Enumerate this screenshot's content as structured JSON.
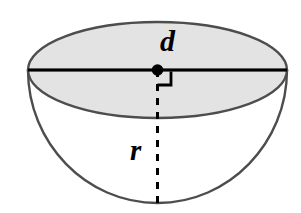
{
  "figure": {
    "name": "hemisphere-diagram",
    "background_color": "#ffffff",
    "labels": {
      "diameter": "d",
      "radius": "r"
    },
    "colors": {
      "outline": "#4d4d4d",
      "diameter_line": "#000000",
      "top_fill": "#e3e3e3",
      "band_fill": "#e3e3e3",
      "bowl_fill": "#ffffff",
      "center_dot": "#000000",
      "dashed_line": "#000000",
      "right_angle": "#000000"
    },
    "geometry": {
      "ellipse_center_x": 157.5,
      "ellipse_center_y": 70,
      "ellipse_radius_x": 129.5,
      "ellipse_radius_y": 48,
      "bowl_bottom_y": 203,
      "center_dot_radius": 5.5,
      "diameter_x1": 28,
      "diameter_x2": 287,
      "diameter_y": 70,
      "dash_pattern": "7,7",
      "right_angle_size": 13,
      "stroke_width_outline": 2.4,
      "stroke_width_diameter": 3.2
    },
    "elements": {
      "top_ellipse": "top-ellipse-face",
      "lower_arc": "lower-ellipse-arc",
      "bowl_outline": "bowl-outline",
      "diameter_segment": "diameter-line",
      "radius_segment": "radius-dashed-line",
      "center_point": "center-dot",
      "right_angle_marker": "right-angle-marker"
    }
  }
}
